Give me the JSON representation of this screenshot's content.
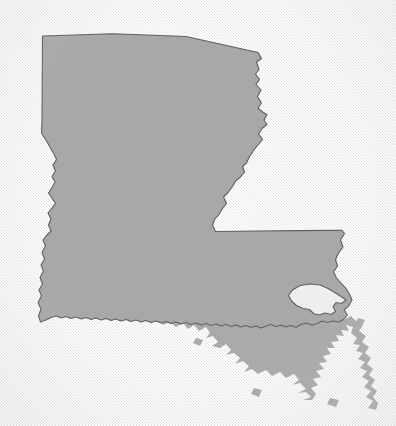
{
  "figure": {
    "kind": "map-silhouette",
    "region_type": "U.S. state outline",
    "title": "",
    "caption": "",
    "labels": [],
    "legend": [],
    "attribution": ""
  },
  "canvas": {
    "width": 396,
    "height": 426,
    "background_color": "#f0f0f0",
    "background_texture": "paper-weave",
    "vignette": true
  },
  "style": {
    "land_fill": "#a9a9a9",
    "land_stroke": "#5f5f5f",
    "land_stroke_width": 1.1,
    "coast_fill": "#ababab",
    "water_fill": "#f0f0f0",
    "shadow": "none"
  },
  "geometry": {
    "mainland_outline": "M 42.5 36.0 L 113 33.8 L 186 36.5 L 258 52.5 L 261.5 58.5 L 256.5 62.0 L 259.0 69.5 L 256.0 74.0 L 259.5 79.5 L 256.5 84.5 L 261.0 90.0 L 258.0 96.5 L 261.5 103.0 L 258.5 108.0 L 262.0 112.0 L 266.5 114.5 L 264.0 120.0 L 266.5 124.5 L 262.0 128.0 L 259.0 134.0 L 262.5 139.5 L 258.0 145.5 L 254.0 150.0 L 250.0 156.0 L 247.0 162.5 L 243.0 166.0 L 244.5 171.5 L 241.0 176.5 L 236.5 180.0 L 233.0 186.0 L 228.5 192.0 L 224.0 196.5 L 226.5 203.0 L 223.0 208.0 L 219.5 214.0 L 215.0 219.0 L 213.0 225.0 L 215.5 231.5 L 258 231.0 L 300 230.6 L 341.5 230.2 L 344.5 233.5 L 341.0 240.0 L 343.0 247.0 L 339.0 253.0 L 336.0 259.5 L 337.5 266.0 L 334.0 272.0 L 336.5 278.0 L 341.0 283.0 L 346.0 288.5 L 349.5 294.0 L 352.0 300.0 L 349.0 306.0 L 344.5 310.0 L 347.5 315.0 L 344.0 319.5 L 339.0 322.0 L 333.0 321.0 L 327.5 322.5 L 322.0 321.0 L 317.5 323.5 L 312.0 325.0 L 306.5 323.0 L 301.0 324.5 L 296.0 327.5 L 291.0 325.5 L 286.0 327.0 L 281.0 325.0 L 276.0 326.5 L 271.0 324.5 L 266.0 326.0 L 261.0 328.0 L 256.0 326.0 L 251.0 327.5 L 246.0 325.5 L 241.0 327.0 L 236.0 325.0 L 231.0 326.5 L 226.0 324.5 L 221.0 326.0 L 216.0 324.0 L 211.0 325.5 L 206.0 323.5 L 201.0 325.0 L 196.0 323.0 L 191.0 324.5 L 186.0 322.5 L 181.0 324.0 L 176.0 322.0 L 171.0 323.5 L 166.0 321.5 L 161.0 323.0 L 156.0 321.0 L 151.0 322.5 L 146.0 320.5 L 141.0 322.0 L 136.0 320.0 L 131.0 321.5 L 126.0 319.5 L 121.0 321.0 L 116.0 319.0 L 111.0 320.5 L 106.0 318.5 L 101.0 320.0 L 96.0 318.0 L 91.0 319.5 L 86.0 317.5 L 81.0 319.0 L 76.0 317.0 L 71.0 318.5 L 66.0 316.5 L 61.0 318.0 L 56.0 316.0 L 51.0 317.5 L 46.0 320.0 L 40.5 322.0 L 38.5 316.0 L 41.0 309.0 L 38.0 302.5 L 41.5 296.0 L 39.0 290.0 L 42.5 284.0 L 40.0 277.5 L 43.5 271.0 L 41.0 265.0 L 44.5 259.0 L 42.0 252.5 L 45.5 246.0 L 43.0 240.0 L 47.0 235.0 L 51.0 231.0 L 48.5 225.0 L 51.0 219.0 L 48.0 213.0 L 52.0 208.0 L 55.5 203.5 L 52.0 198.0 L 48.5 193.0 L 52.0 187.5 L 55.0 182.0 L 52.0 176.5 L 55.5 171.0 L 53.0 165.0 L 56.5 159.5 L 54.0 154.0 L 51.0 149.0 L 48.0 143.5 L 44.5 138.0 L 41.5 133.0 L 42.0 120.0 Z",
    "lake_pontchartrain": "M 292.5 290.0 L 300.0 285.5 L 310.0 284.0 L 320.0 285.0 L 328.0 288.5 L 338.0 294.5 L 346.0 300.0 L 341.5 303.5 L 336.0 302.5 L 333.0 306.5 L 335.5 311.5 L 331.0 314.5 L 325.0 313.0 L 319.0 315.0 L 313.5 313.5 L 309.5 309.5 L 303.0 308.5 L 296.5 305.5 L 291.5 301.0 L 288.5 295.5 Z",
    "delta_features": "jagged-coastline-and-birdsfoot-delta",
    "bounds": {
      "min_x": 36,
      "min_y": 33,
      "max_x": 378,
      "max_y": 412
    }
  }
}
